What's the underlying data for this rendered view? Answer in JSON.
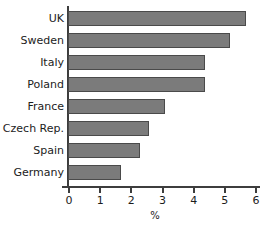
{
  "chart_data": {
    "type": "bar",
    "orientation": "horizontal",
    "title": "",
    "xlabel": "%",
    "ylabel": "",
    "xlim": [
      0,
      6
    ],
    "xticks": [
      0,
      1,
      2,
      3,
      4,
      5,
      6
    ],
    "xtick_labels": [
      "0",
      "1",
      "2",
      "3",
      "4",
      "5",
      "6"
    ],
    "grid": false,
    "legend": false,
    "categories": [
      "UK",
      "Sweden",
      "Italy",
      "Poland",
      "France",
      "Czech Rep.",
      "Spain",
      "Germany"
    ],
    "values": [
      5.7,
      5.2,
      4.4,
      4.4,
      3.1,
      2.6,
      2.3,
      1.7
    ],
    "bars": [
      {
        "label": "UK",
        "value": 5.7
      },
      {
        "label": "Sweden",
        "value": 5.2
      },
      {
        "label": "Italy",
        "value": 4.4
      },
      {
        "label": "Poland",
        "value": 4.4
      },
      {
        "label": "France",
        "value": 3.1
      },
      {
        "label": "Czech Rep.",
        "value": 2.6
      },
      {
        "label": "Spain",
        "value": 2.3
      },
      {
        "label": "Germany",
        "value": 1.7
      }
    ],
    "colors": {
      "bar_fill": "#7b7b7b",
      "bar_stroke": "#4a4a4a",
      "axis": "#3d3d3d",
      "text": "#1c1c1c",
      "background": "#ffffff"
    }
  }
}
